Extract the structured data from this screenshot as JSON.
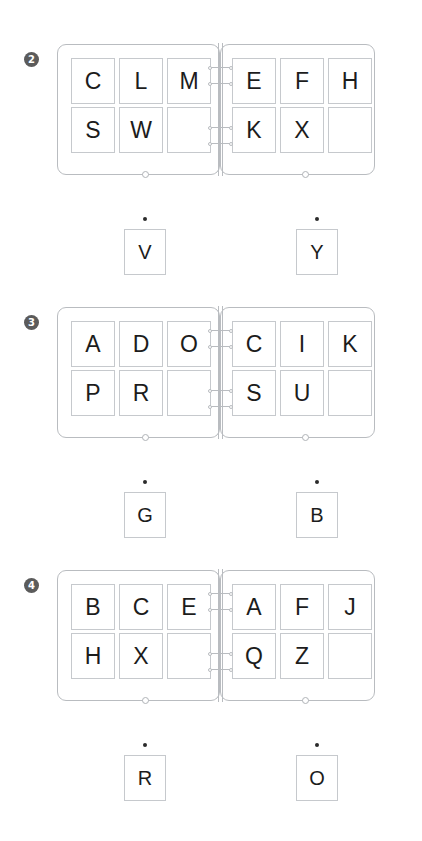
{
  "document": {
    "title": "Ring Binder Letter Puzzle Worksheet",
    "background_color": "#ffffff",
    "tile_border_color": "#c6c9cd",
    "binder_border_color": "#b9bcc0",
    "badge_color": "#5b5b5b",
    "text_color": "#1c1c1c",
    "dot_color": "#2b2b2b"
  },
  "puzzles": [
    {
      "badge": "2",
      "left_page": {
        "rows": [
          [
            "C",
            "L",
            "M"
          ],
          [
            "S",
            "W",
            ""
          ]
        ]
      },
      "right_page": {
        "rows": [
          [
            "E",
            "F",
            "H"
          ],
          [
            "K",
            "X",
            ""
          ]
        ]
      },
      "answers": [
        {
          "letter": "V"
        },
        {
          "letter": "Y"
        }
      ]
    },
    {
      "badge": "3",
      "left_page": {
        "rows": [
          [
            "A",
            "D",
            "O"
          ],
          [
            "P",
            "R",
            ""
          ]
        ]
      },
      "right_page": {
        "rows": [
          [
            "C",
            "I",
            "K"
          ],
          [
            "S",
            "U",
            ""
          ]
        ]
      },
      "answers": [
        {
          "letter": "G"
        },
        {
          "letter": "B"
        }
      ]
    },
    {
      "badge": "4",
      "left_page": {
        "rows": [
          [
            "B",
            "C",
            "E"
          ],
          [
            "H",
            "X",
            ""
          ]
        ]
      },
      "right_page": {
        "rows": [
          [
            "A",
            "F",
            "J"
          ],
          [
            "Q",
            "Z",
            ""
          ]
        ]
      },
      "answers": [
        {
          "letter": "R"
        },
        {
          "letter": "O"
        }
      ]
    }
  ]
}
